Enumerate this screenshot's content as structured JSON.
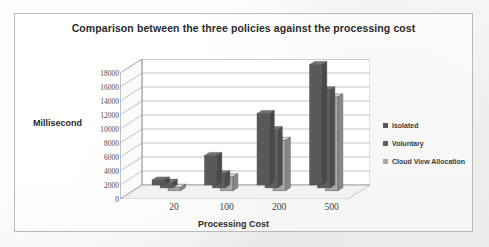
{
  "chart_data": {
    "type": "bar",
    "title": "Comparison between the three policies against the processing cost",
    "xlabel": "Processing Cost",
    "ylabel": "Millisecond",
    "categories": [
      "20",
      "100",
      "200",
      "500"
    ],
    "series": [
      {
        "name": "Isolated",
        "color": "#595959",
        "values": [
          700,
          4200,
          10200,
          17200
        ]
      },
      {
        "name": "Voluntary",
        "color": "#5e5e5e",
        "values": [
          800,
          2000,
          8300,
          14000
        ]
      },
      {
        "name": "Cloud View Allocation",
        "color": "#a6a6a6",
        "values": [
          500,
          2000,
          7200,
          13400
        ]
      }
    ],
    "ylim": [
      0,
      18000
    ],
    "ytick_step": 2000,
    "yticks": [
      "18000",
      "16000",
      "14000",
      "12000",
      "10000",
      "8000",
      "6000",
      "4000",
      "2000",
      "0"
    ],
    "grid": true,
    "legend_position": "right",
    "projection": "3d-clustered-column"
  },
  "legend": {
    "items": [
      {
        "label": "Isolated",
        "swatch": "#595959"
      },
      {
        "label": "Voluntary",
        "swatch": "#5e5e5e"
      },
      {
        "label": "Cloud View Allocation",
        "swatch": "#a6a6a6"
      }
    ]
  },
  "colors": {
    "bar_dark": "#595959",
    "bar_mid": "#5e5e5e",
    "bar_light": "#a6a6a6",
    "grid": "#9a9a9a",
    "frame": "#b9b9b9",
    "text": "#2b2b2b",
    "background": "#f3f3f1"
  }
}
